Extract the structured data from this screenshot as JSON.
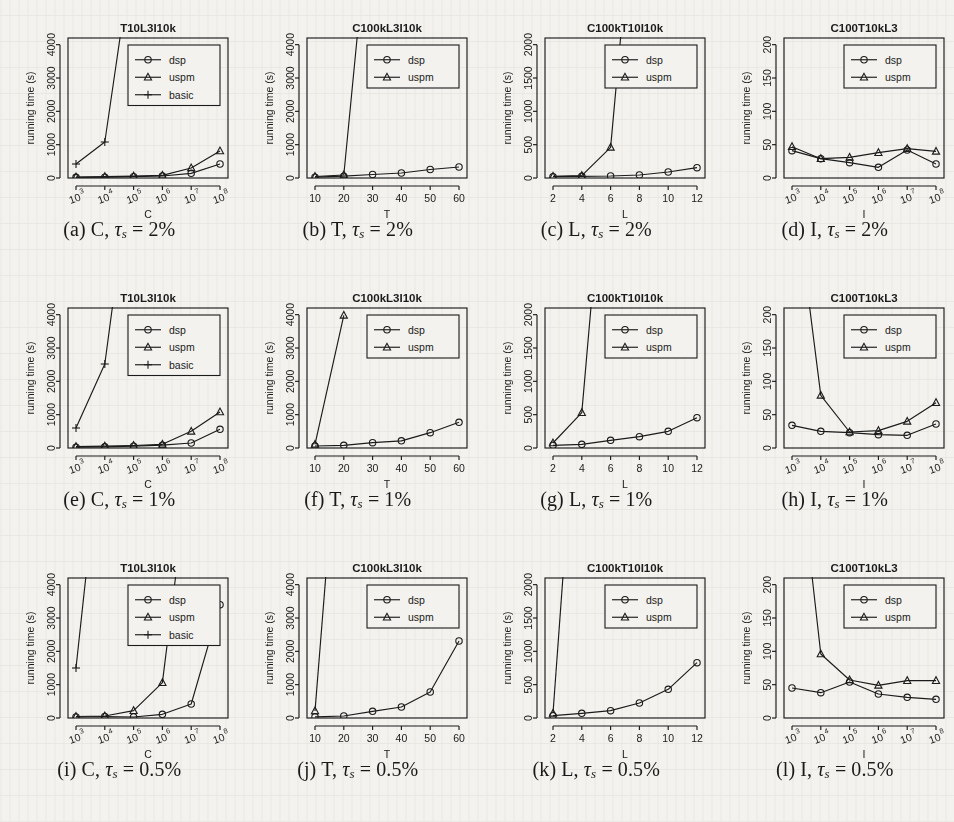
{
  "figure": {
    "marker_legend": [
      "dsp",
      "uspm",
      "basic"
    ],
    "ylabel": "running time (s)"
  },
  "panels": [
    {
      "id": "a",
      "caption_prefix": "(a)",
      "caption_var": "C,",
      "caption_tau": "τ",
      "caption_sub": "s",
      "caption_value": "= 2%",
      "chart_data": {
        "type": "line",
        "title": "T10L3I10k",
        "xlabel": "C",
        "ylabel": "running time (s)",
        "xticklabels": [
          "10^3",
          "10^4",
          "10^5",
          "10^6",
          "10^7",
          "10^8"
        ],
        "x": [
          1,
          2,
          3,
          4,
          5,
          6
        ],
        "ylim": [
          0,
          4200
        ],
        "yticks": [
          0,
          1000,
          2000,
          3000,
          4000
        ],
        "legend": [
          "dsp",
          "uspm",
          "basic"
        ],
        "legend_position": "top-right",
        "series": [
          {
            "name": "dsp",
            "marker": "circle",
            "values": [
              20,
              25,
              40,
              60,
              140,
              420
            ]
          },
          {
            "name": "uspm",
            "marker": "triangle",
            "values": [
              30,
              40,
              55,
              80,
              300,
              810
            ]
          },
          {
            "name": "basic",
            "marker": "plus",
            "values": [
              420,
              1080,
              7000,
              null,
              null,
              null
            ]
          }
        ]
      }
    },
    {
      "id": "b",
      "caption_prefix": "(b)",
      "caption_var": "T,",
      "caption_tau": "τ",
      "caption_sub": "s",
      "caption_value": "= 2%",
      "chart_data": {
        "type": "line",
        "title": "C100kL3I10k",
        "xlabel": "T",
        "ylabel": "running time (s)",
        "xticklabels": [
          "10",
          "20",
          "30",
          "40",
          "50",
          "60"
        ],
        "x": [
          10,
          20,
          30,
          40,
          50,
          60
        ],
        "ylim": [
          0,
          4200
        ],
        "yticks": [
          0,
          1000,
          2000,
          3000,
          4000
        ],
        "legend": [
          "dsp",
          "uspm"
        ],
        "legend_position": "top-right",
        "series": [
          {
            "name": "dsp",
            "marker": "circle",
            "values": [
              25,
              55,
              105,
              150,
              255,
              330
            ]
          },
          {
            "name": "uspm",
            "marker": "triangle",
            "values": [
              45,
              90,
              9000,
              null,
              null,
              null
            ]
          }
        ]
      }
    },
    {
      "id": "c",
      "caption_prefix": "(c)",
      "caption_var": "L,",
      "caption_tau": "τ",
      "caption_sub": "s",
      "caption_value": "= 2%",
      "chart_data": {
        "type": "line",
        "title": "C100kT10I10k",
        "xlabel": "L",
        "ylabel": "running time (s)",
        "xticklabels": [
          "2",
          "4",
          "6",
          "8",
          "10",
          "12"
        ],
        "x": [
          2,
          4,
          6,
          8,
          10,
          12
        ],
        "ylim": [
          0,
          2100
        ],
        "yticks": [
          0,
          500,
          1000,
          1500,
          2000
        ],
        "legend": [
          "dsp",
          "uspm"
        ],
        "legend_position": "top-right",
        "series": [
          {
            "name": "dsp",
            "marker": "circle",
            "values": [
              20,
              25,
              30,
              45,
              90,
              155
            ]
          },
          {
            "name": "uspm",
            "marker": "triangle",
            "values": [
              25,
              35,
              460,
              5200,
              null,
              null
            ]
          }
        ]
      }
    },
    {
      "id": "d",
      "caption_prefix": "(d)",
      "caption_var": "I,",
      "caption_tau": "τ",
      "caption_sub": "s",
      "caption_value": "= 2%",
      "chart_data": {
        "type": "line",
        "title": "C100T10kL3",
        "xlabel": "I",
        "ylabel": "running time (s)",
        "xticklabels": [
          "10^3",
          "10^4",
          "10^5",
          "10^6",
          "10^7",
          "10^8"
        ],
        "x": [
          1,
          2,
          3,
          4,
          5,
          6
        ],
        "ylim": [
          0,
          210
        ],
        "yticks": [
          0,
          50,
          100,
          150,
          200
        ],
        "legend": [
          "dsp",
          "uspm"
        ],
        "legend_position": "top-right",
        "series": [
          {
            "name": "dsp",
            "marker": "circle",
            "values": [
              41,
              29,
              23,
              16,
              42,
              21
            ]
          },
          {
            "name": "uspm",
            "marker": "triangle",
            "values": [
              47,
              29,
              31,
              38,
              44,
              40
            ]
          }
        ]
      }
    },
    {
      "id": "e",
      "caption_prefix": "(e)",
      "caption_var": "C,",
      "caption_tau": "τ",
      "caption_sub": "s",
      "caption_value": "= 1%",
      "chart_data": {
        "type": "line",
        "title": "T10L3I10k",
        "xlabel": "C",
        "ylabel": "running time (s)",
        "xticklabels": [
          "10^3",
          "10^4",
          "10^5",
          "10^6",
          "10^7",
          "10^8"
        ],
        "x": [
          1,
          2,
          3,
          4,
          5,
          6
        ],
        "ylim": [
          0,
          4200
        ],
        "yticks": [
          0,
          1000,
          2000,
          3000,
          4000
        ],
        "legend": [
          "dsp",
          "uspm",
          "basic"
        ],
        "legend_position": "top-right",
        "series": [
          {
            "name": "dsp",
            "marker": "circle",
            "values": [
              25,
              35,
              55,
              85,
              150,
              560
            ]
          },
          {
            "name": "uspm",
            "marker": "triangle",
            "values": [
              40,
              55,
              75,
              110,
              500,
              1080
            ]
          },
          {
            "name": "basic",
            "marker": "plus",
            "values": [
              600,
              2520,
              9000,
              null,
              null,
              null
            ]
          }
        ]
      }
    },
    {
      "id": "f",
      "caption_prefix": "(f)",
      "caption_var": "T,",
      "caption_tau": "τ",
      "caption_sub": "s",
      "caption_value": "= 1%",
      "chart_data": {
        "type": "line",
        "title": "C100kL3I10k",
        "xlabel": "T",
        "ylabel": "running time (s)",
        "xticklabels": [
          "10",
          "20",
          "30",
          "40",
          "50",
          "60"
        ],
        "x": [
          10,
          20,
          30,
          40,
          50,
          60
        ],
        "ylim": [
          0,
          4200
        ],
        "yticks": [
          0,
          1000,
          2000,
          3000,
          4000
        ],
        "legend": [
          "dsp",
          "uspm"
        ],
        "legend_position": "top-right",
        "series": [
          {
            "name": "dsp",
            "marker": "circle",
            "values": [
              60,
              80,
              160,
              215,
              460,
              770
            ]
          },
          {
            "name": "uspm",
            "marker": "triangle",
            "values": [
              110,
              3980,
              null,
              null,
              null,
              null
            ]
          }
        ]
      }
    },
    {
      "id": "g",
      "caption_prefix": "(g)",
      "caption_var": "L,",
      "caption_tau": "τ",
      "caption_sub": "s",
      "caption_value": "= 1%",
      "chart_data": {
        "type": "line",
        "title": "C100kT10I10k",
        "xlabel": "L",
        "ylabel": "running time (s)",
        "xticklabels": [
          "2",
          "4",
          "6",
          "8",
          "10",
          "12"
        ],
        "x": [
          2,
          4,
          6,
          8,
          10,
          12
        ],
        "ylim": [
          0,
          2100
        ],
        "yticks": [
          0,
          500,
          1000,
          1500,
          2000
        ],
        "legend": [
          "dsp",
          "uspm"
        ],
        "legend_position": "top-right",
        "series": [
          {
            "name": "dsp",
            "marker": "circle",
            "values": [
              40,
              55,
              115,
              170,
              250,
              455
            ]
          },
          {
            "name": "uspm",
            "marker": "triangle",
            "values": [
              75,
              530,
              5500,
              null,
              null,
              null
            ]
          }
        ]
      }
    },
    {
      "id": "h",
      "caption_prefix": "(h)",
      "caption_var": "I,",
      "caption_tau": "τ",
      "caption_sub": "s",
      "caption_value": "= 1%",
      "chart_data": {
        "type": "line",
        "title": "C100T10kL3",
        "xlabel": "I",
        "ylabel": "running time (s)",
        "xticklabels": [
          "10^3",
          "10^4",
          "10^5",
          "10^6",
          "10^7",
          "10^8"
        ],
        "x": [
          1,
          2,
          3,
          4,
          5,
          6
        ],
        "ylim": [
          0,
          210
        ],
        "yticks": [
          0,
          50,
          100,
          150,
          200
        ],
        "legend": [
          "dsp",
          "uspm"
        ],
        "legend_position": "top-right",
        "series": [
          {
            "name": "dsp",
            "marker": "circle",
            "values": [
              34,
              25,
              23,
              20,
              19,
              36
            ]
          },
          {
            "name": "uspm",
            "marker": "triangle",
            "values": [
              420,
              79,
              24,
              26,
              40,
              68
            ]
          }
        ]
      }
    },
    {
      "id": "i",
      "caption_prefix": "(i)",
      "caption_var": "C,",
      "caption_tau": "τ",
      "caption_sub": "s",
      "caption_value": "= 0.5%",
      "chart_data": {
        "type": "line",
        "title": "T10L3I10k",
        "xlabel": "C",
        "ylabel": "running time (s)",
        "xticklabels": [
          "10^3",
          "10^4",
          "10^5",
          "10^6",
          "10^7",
          "10^8"
        ],
        "x": [
          1,
          2,
          3,
          4,
          5,
          6
        ],
        "ylim": [
          0,
          4200
        ],
        "yticks": [
          0,
          1000,
          2000,
          3000,
          4000
        ],
        "legend": [
          "dsp",
          "uspm",
          "basic"
        ],
        "legend_position": "top-right",
        "series": [
          {
            "name": "dsp",
            "marker": "circle",
            "values": [
              30,
              45,
              30,
              110,
              420,
              3400
            ]
          },
          {
            "name": "uspm",
            "marker": "triangle",
            "values": [
              45,
              60,
              220,
              1060,
              8000,
              null
            ]
          },
          {
            "name": "basic",
            "marker": "plus",
            "values": [
              1500,
              9500,
              null,
              null,
              null,
              null
            ]
          }
        ]
      }
    },
    {
      "id": "j",
      "caption_prefix": "(j)",
      "caption_var": "T,",
      "caption_tau": "τ",
      "caption_sub": "s",
      "caption_value": "= 0.5%",
      "chart_data": {
        "type": "line",
        "title": "C100kL3I10k",
        "xlabel": "T",
        "ylabel": "running time (s)",
        "xticklabels": [
          "10",
          "20",
          "30",
          "40",
          "50",
          "60"
        ],
        "x": [
          10,
          20,
          30,
          40,
          50,
          60
        ],
        "ylim": [
          0,
          4200
        ],
        "yticks": [
          0,
          1000,
          2000,
          3000,
          4000
        ],
        "legend": [
          "dsp",
          "uspm"
        ],
        "legend_position": "top-right",
        "series": [
          {
            "name": "dsp",
            "marker": "circle",
            "values": [
              35,
              60,
              200,
              330,
              780,
              2310
            ]
          },
          {
            "name": "uspm",
            "marker": "triangle",
            "values": [
              210,
              11000,
              null,
              null,
              null,
              null
            ]
          }
        ]
      }
    },
    {
      "id": "k",
      "caption_prefix": "(k)",
      "caption_var": "L,",
      "caption_tau": "τ",
      "caption_sub": "s",
      "caption_value": "= 0.5%",
      "chart_data": {
        "type": "line",
        "title": "C100kT10I10k",
        "xlabel": "L",
        "ylabel": "running time (s)",
        "xticklabels": [
          "2",
          "4",
          "6",
          "8",
          "10",
          "12"
        ],
        "x": [
          2,
          4,
          6,
          8,
          10,
          12
        ],
        "ylim": [
          0,
          2100
        ],
        "yticks": [
          0,
          500,
          1000,
          1500,
          2000
        ],
        "legend": [
          "dsp",
          "uspm"
        ],
        "legend_position": "top-right",
        "series": [
          {
            "name": "dsp",
            "marker": "circle",
            "values": [
              35,
              70,
              110,
              225,
              430,
              830
            ]
          },
          {
            "name": "uspm",
            "marker": "triangle",
            "values": [
              70,
              6000,
              null,
              null,
              null,
              null
            ]
          }
        ]
      }
    },
    {
      "id": "l",
      "caption_prefix": "(l)",
      "caption_var": "I,",
      "caption_tau": "τ",
      "caption_sub": "s",
      "caption_value": "= 0.5%",
      "chart_data": {
        "type": "line",
        "title": "C100T10kL3",
        "xlabel": "I",
        "ylabel": "running time (s)",
        "xticklabels": [
          "10^3",
          "10^4",
          "10^5",
          "10^6",
          "10^7",
          "10^8"
        ],
        "x": [
          1,
          2,
          3,
          4,
          5,
          6
        ],
        "ylim": [
          0,
          210
        ],
        "yticks": [
          0,
          50,
          100,
          150,
          200
        ],
        "legend": [
          "dsp",
          "uspm"
        ],
        "legend_position": "top-right",
        "series": [
          {
            "name": "dsp",
            "marker": "circle",
            "values": [
              45,
              38,
              54,
              36,
              31,
              28
            ]
          },
          {
            "name": "uspm",
            "marker": "triangle",
            "values": [
              480,
              96,
              57,
              49,
              56,
              56
            ]
          }
        ]
      }
    }
  ]
}
